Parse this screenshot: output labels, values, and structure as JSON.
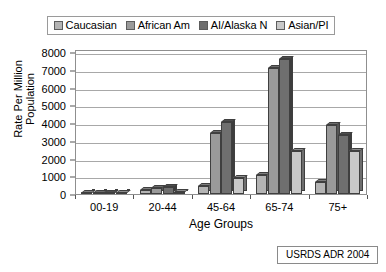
{
  "chart_data": {
    "type": "bar",
    "title": "",
    "xlabel": "Age Groups",
    "ylabel": "Rate Per Million Population",
    "ylabel_lines": [
      "Rate Per Million",
      "Population"
    ],
    "categories": [
      "00-19",
      "20-44",
      "45-64",
      "65-74",
      "75+"
    ],
    "ylim": [
      0,
      8000
    ],
    "ytick_step": 1000,
    "yticks": [
      "0",
      "1000",
      "2000",
      "3000",
      "4000",
      "5000",
      "6000",
      "7000",
      "8000"
    ],
    "grid": true,
    "legend_position": "top-center",
    "series": [
      {
        "name": "Caucasian",
        "color": "#b4b4b4",
        "values": [
          40,
          230,
          460,
          1090,
          660
        ]
      },
      {
        "name": "African Am",
        "color": "#9a9a9a",
        "values": [
          55,
          330,
          3450,
          7080,
          3900
        ]
      },
      {
        "name": "AI/Alaska N",
        "color": "#6f6f6f",
        "values": [
          45,
          390,
          4080,
          7600,
          3350
        ]
      },
      {
        "name": "Asian/PI",
        "color": "#c8c8c8",
        "values": [
          25,
          120,
          880,
          2450,
          2420
        ]
      }
    ],
    "annotations": [
      "USRDS ADR 2004"
    ]
  },
  "legend": {
    "items": [
      {
        "label": "Caucasian",
        "color": "#b4b4b4"
      },
      {
        "label": "African Am",
        "color": "#9a9a9a"
      },
      {
        "label": "AI/Alaska N",
        "color": "#6f6f6f"
      },
      {
        "label": "Asian/PI",
        "color": "#c8c8c8"
      }
    ]
  },
  "source": {
    "text": "USRDS ADR 2004"
  },
  "colors": {
    "grid": "#a8a8a8",
    "axis": "#8f8f8f",
    "bar_outline": "#3f3f3f",
    "background": "#ffffff"
  }
}
